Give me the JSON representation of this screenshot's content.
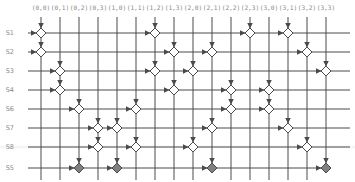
{
  "diagram": {
    "columns": [
      "(0,0)",
      "(0,1)",
      "(0,2)",
      "(0,3)",
      "(1,0)",
      "(1,1)",
      "(1,2)",
      "(1,3)",
      "(2,0)",
      "(2,1)",
      "(2,2)",
      "(2,3)",
      "(3,0)",
      "(3,1)",
      "(3,2)",
      "(3,3)"
    ],
    "rows": [
      {
        "label": "S1",
        "nodes": [
          "(0,0)",
          "(1,2)",
          "(2,3)",
          "(3,1)"
        ],
        "filled": false
      },
      {
        "label": "S2",
        "nodes": [
          "(0,0)",
          "(1,3)",
          "(2,1)",
          "(3,2)"
        ],
        "filled": false
      },
      {
        "label": "S3",
        "nodes": [
          "(0,1)",
          "(1,2)",
          "(2,0)",
          "(3,3)"
        ],
        "filled": false
      },
      {
        "label": "S4",
        "nodes": [
          "(0,1)",
          "(1,3)",
          "(2,2)",
          "(3,0)"
        ],
        "filled": false
      },
      {
        "label": "S6",
        "nodes": [
          "(0,2)",
          "(1,1)",
          "(2,2)",
          "(3,0)"
        ],
        "filled": false
      },
      {
        "label": "S7",
        "nodes": [
          "(0,3)",
          "(1,0)",
          "(2,1)",
          "(3,1)"
        ],
        "filled": false
      },
      {
        "label": "S8",
        "nodes": [
          "(0,3)",
          "(1,1)",
          "(2,0)",
          "(3,2)"
        ],
        "filled": false
      },
      {
        "label": "S5",
        "nodes": [
          "(0,2)",
          "(1,0)",
          "(2,1)",
          "(3,3)"
        ],
        "filled": true
      }
    ],
    "colors": {
      "line": "#4a4a4a",
      "open_node": "#ffffff",
      "filled_node": "#808080",
      "label": "#8a8a8a"
    }
  }
}
